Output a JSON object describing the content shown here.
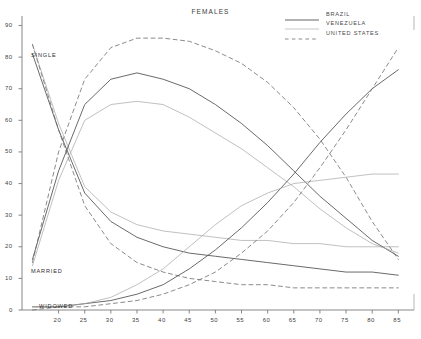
{
  "chart_data": {
    "type": "line",
    "title": "FEMALES",
    "xlabel": "",
    "ylabel": "",
    "xlim": [
      13,
      88
    ],
    "ylim": [
      0,
      93
    ],
    "grid": false,
    "legend_position": "top-right",
    "x_ticks": [
      20,
      25,
      30,
      35,
      40,
      45,
      50,
      55,
      60,
      65,
      70,
      75,
      80,
      85
    ],
    "y_ticks": [
      0,
      10,
      20,
      30,
      40,
      50,
      60,
      70,
      80,
      90
    ],
    "y_origin_label": "0",
    "annotations": [
      "SINGLE",
      "MARRIED",
      "WIDOWED"
    ],
    "legend": [
      {
        "name": "BRAZIL",
        "style": "solid",
        "color": "#555555"
      },
      {
        "name": "VENEZUELA",
        "style": "solid-thin",
        "color": "#9a9a9a"
      },
      {
        "name": "UNITED STATES",
        "style": "dashed",
        "color": "#707070"
      }
    ],
    "x": [
      15,
      20,
      25,
      30,
      35,
      40,
      45,
      50,
      55,
      60,
      65,
      70,
      75,
      80,
      85
    ],
    "series": [
      {
        "name": "BRAZIL-SINGLE",
        "country": "BRAZIL",
        "status": "SINGLE",
        "style": "solid",
        "values": [
          81,
          57,
          37,
          28,
          23,
          20,
          18,
          17,
          16,
          15,
          14,
          13,
          12,
          12,
          11
        ]
      },
      {
        "name": "VENEZUELA-SINGLE",
        "country": "VENEZUELA",
        "status": "SINGLE",
        "style": "solid-thin",
        "values": [
          84,
          59,
          39,
          31,
          27,
          25,
          24,
          23,
          22,
          22,
          21,
          21,
          20,
          20,
          20
        ]
      },
      {
        "name": "UNITEDSTATES-SINGLE",
        "country": "UNITED STATES",
        "status": "SINGLE",
        "style": "dashed",
        "values": [
          84,
          57,
          33,
          21,
          15,
          12,
          10,
          9,
          8,
          8,
          7,
          7,
          7,
          7,
          7
        ]
      },
      {
        "name": "BRAZIL-MARRIED",
        "country": "BRAZIL",
        "status": "MARRIED",
        "style": "solid",
        "values": [
          16,
          44,
          65,
          73,
          75,
          73,
          70,
          65,
          59,
          52,
          44,
          36,
          29,
          22,
          17
        ]
      },
      {
        "name": "VENEZUELA-MARRIED",
        "country": "VENEZUELA",
        "status": "MARRIED",
        "style": "solid-thin",
        "values": [
          14,
          41,
          60,
          65,
          66,
          65,
          61,
          56,
          51,
          45,
          39,
          32,
          26,
          21,
          18
        ]
      },
      {
        "name": "UNITEDSTATES-MARRIED",
        "country": "UNITED STATES",
        "status": "MARRIED",
        "style": "dashed",
        "values": [
          15,
          50,
          73,
          83,
          86,
          86,
          85,
          82,
          78,
          72,
          64,
          54,
          42,
          28,
          16
        ]
      },
      {
        "name": "BRAZIL-WIDOWED",
        "country": "BRAZIL",
        "status": "WIDOWED",
        "style": "solid",
        "values": [
          1,
          1,
          2,
          3,
          5,
          8,
          13,
          19,
          26,
          34,
          43,
          53,
          62,
          70,
          76
        ]
      },
      {
        "name": "VENEZUELA-WIDOWED",
        "country": "VENEZUELA",
        "status": "WIDOWED",
        "style": "solid-thin",
        "values": [
          1,
          1,
          2,
          4,
          8,
          13,
          20,
          27,
          33,
          37,
          40,
          41,
          42,
          43,
          43
        ]
      },
      {
        "name": "UNITEDSTATES-WIDOWED",
        "country": "UNITED STATES",
        "status": "WIDOWED",
        "style": "dashed",
        "values": [
          0,
          1,
          1,
          2,
          3,
          5,
          8,
          12,
          18,
          25,
          34,
          45,
          57,
          70,
          83
        ]
      }
    ]
  },
  "axis": {
    "x_tick_labels": [
      "20",
      "25",
      "30",
      "35",
      "40",
      "45",
      "50",
      "55",
      "60",
      "65",
      "70",
      "75",
      "80",
      "85"
    ],
    "y_tick_labels": [
      "90",
      "80",
      "70",
      "60",
      "50",
      "40",
      "30",
      "20",
      "10",
      "0"
    ],
    "origin_label": "0"
  },
  "annotations": {
    "single": "SINGLE",
    "married": "MARRIED",
    "widowed": "WIDOWED"
  }
}
